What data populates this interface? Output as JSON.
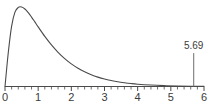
{
  "chart_data": {
    "type": "line",
    "title": "",
    "subtitle": "",
    "xlabel": "",
    "ylabel": "",
    "xlim": [
      0,
      6
    ],
    "ylim": [
      0,
      1.05
    ],
    "grid": false,
    "legend": null,
    "axis_color": "#4a4a4a",
    "curve_color": "#4a4a4a",
    "annotation_color": "#6e6e6e",
    "x_major_ticks": [
      0,
      1,
      2,
      3,
      4,
      5,
      6
    ],
    "x_tick_labels": [
      "0",
      "1",
      "2",
      "3",
      "4",
      "5",
      "6"
    ],
    "x_minor_tick_step": 0.2,
    "series": [
      {
        "name": "density",
        "x": [
          0.0,
          0.1,
          0.2,
          0.3,
          0.4,
          0.5,
          0.6,
          0.7,
          0.8,
          0.9,
          1.0,
          1.2,
          1.4,
          1.6,
          1.8,
          2.0,
          2.2,
          2.4,
          2.6,
          2.8,
          3.0,
          3.2,
          3.4,
          3.6,
          3.8,
          4.0,
          4.4,
          4.8,
          5.2,
          5.6,
          6.0
        ],
        "y": [
          0.0,
          0.43,
          0.76,
          0.935,
          0.995,
          1.0,
          0.975,
          0.93,
          0.873,
          0.812,
          0.75,
          0.63,
          0.523,
          0.43,
          0.351,
          0.285,
          0.23,
          0.185,
          0.148,
          0.118,
          0.094,
          0.075,
          0.059,
          0.047,
          0.037,
          0.029,
          0.018,
          0.011,
          0.007,
          0.004,
          0.002
        ]
      }
    ],
    "annotations": [
      {
        "name": "critical-value",
        "label": "5.69",
        "x": 5.69,
        "marker": "vertical-drop-line",
        "line_top_y": 0.42
      }
    ]
  }
}
